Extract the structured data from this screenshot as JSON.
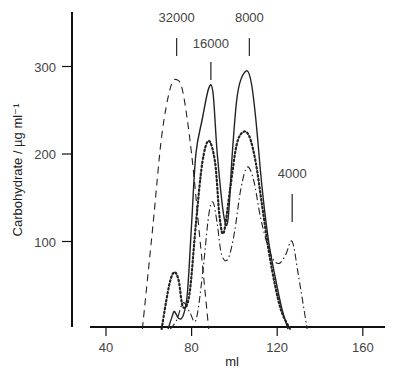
{
  "chart_data": {
    "type": "line",
    "title": "",
    "xlabel": "ml",
    "ylabel": "Carbohydrate / µg ml⁻¹",
    "xlim": [
      30,
      170
    ],
    "ylim": [
      0,
      350
    ],
    "xticks": [
      40,
      80,
      120,
      160
    ],
    "yticks": [
      100,
      200,
      300
    ],
    "grid": false,
    "legend": "none",
    "markers": [
      {
        "label": "32000",
        "x": 73
      },
      {
        "label": "16000",
        "x": 89
      },
      {
        "label": "8000",
        "x": 107
      },
      {
        "label": "4000",
        "x": 127
      }
    ],
    "series": [
      {
        "name": "dashed",
        "style": "dashed",
        "x": [
          57,
          62,
          66,
          70,
          73,
          76,
          80,
          84,
          88
        ],
        "y": [
          0,
          120,
          220,
          275,
          285,
          270,
          200,
          100,
          0
        ]
      },
      {
        "name": "solid",
        "style": "solid",
        "x": [
          69,
          71,
          72,
          74,
          76,
          78,
          80,
          82,
          85,
          88,
          90,
          92,
          95,
          97,
          99,
          101,
          103,
          106,
          108,
          110,
          113,
          116,
          119,
          122,
          125
        ],
        "y": [
          0,
          15,
          20,
          12,
          15,
          40,
          120,
          200,
          240,
          275,
          270,
          200,
          130,
          125,
          200,
          260,
          285,
          295,
          280,
          240,
          160,
          100,
          60,
          25,
          0
        ]
      },
      {
        "name": "dotted",
        "style": "dotted",
        "x": [
          66,
          68,
          70,
          72,
          74,
          76,
          79,
          82,
          85,
          88,
          91,
          93,
          95,
          98,
          101,
          104,
          107,
          110,
          113,
          116,
          119,
          122,
          126
        ],
        "y": [
          0,
          30,
          55,
          65,
          55,
          25,
          40,
          120,
          190,
          215,
          190,
          130,
          110,
          160,
          210,
          225,
          220,
          190,
          140,
          90,
          50,
          20,
          0
        ]
      },
      {
        "name": "dash-dot",
        "style": "dash-dot",
        "x": [
          70,
          73,
          76,
          79,
          82,
          85,
          88,
          90,
          92,
          94,
          97,
          100,
          103,
          106,
          109,
          112,
          115,
          118,
          121,
          124,
          127,
          130,
          134
        ],
        "y": [
          0,
          10,
          30,
          20,
          10,
          60,
          130,
          145,
          120,
          85,
          80,
          110,
          160,
          185,
          170,
          130,
          100,
          80,
          75,
          85,
          100,
          60,
          0
        ]
      }
    ]
  }
}
